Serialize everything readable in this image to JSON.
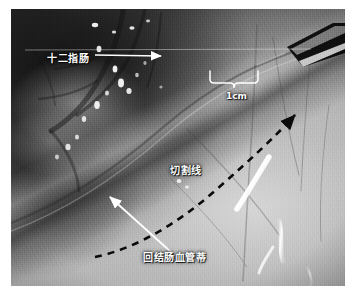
{
  "image": {
    "kind": "laparoscopic-surgical-photograph",
    "modality": "endoscopic video still",
    "color_mode": "grayscale",
    "border_color": "#ffffff",
    "frame": {
      "x": 11,
      "y": 9,
      "width": 334,
      "height": 277
    }
  },
  "annotations": {
    "labels": [
      {
        "id": "duodenum",
        "text": "十二指肠",
        "meaning": "duodenum",
        "color": "#ffffff",
        "pointer": "white-arrow-right"
      },
      {
        "id": "scale",
        "text": "1cm",
        "meaning": "one centimetre scale bar",
        "color": "#ffffff",
        "pointer": "white-brace"
      },
      {
        "id": "cut_line",
        "text": "切割线",
        "meaning": "cutting line / resection line",
        "color": "#ffffff",
        "pointer": "black-dashed-curve"
      },
      {
        "id": "pedicle",
        "text": "回结肠血管蒂",
        "meaning": "ileocolic vascular pedicle",
        "color": "#ffffff",
        "pointer": "white-arrow-up-left"
      }
    ],
    "markers": [
      {
        "id": "dashed-resection-curve",
        "style": "black dashed",
        "shape": "curve with arrowhead at upper-right"
      },
      {
        "id": "scale-brace",
        "style": "white thin line",
        "shape": "curly brace spanning 1cm"
      },
      {
        "id": "duodenum-arrow",
        "style": "white solid",
        "shape": "horizontal arrow pointing right"
      },
      {
        "id": "pedicle-arrow",
        "style": "white solid",
        "shape": "diagonal arrow pointing upper-left"
      }
    ],
    "instrument": {
      "id": "laparoscopic-grasper",
      "position": "top-right corner",
      "color": "#121212"
    }
  }
}
